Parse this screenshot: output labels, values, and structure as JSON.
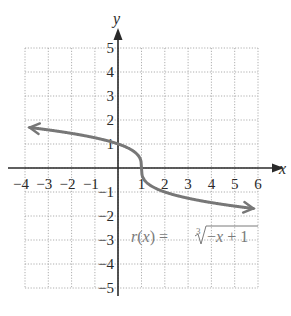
{
  "chart_data": {
    "type": "line",
    "title": "",
    "xlabel": "x",
    "ylabel": "y",
    "xlim": [
      -4,
      6
    ],
    "ylim": [
      -5,
      5
    ],
    "grid": true,
    "grid_style": "dotted",
    "x_ticks": [
      "-4",
      "-3",
      "-2",
      "-1",
      "1",
      "2",
      "3",
      "4",
      "5",
      "6"
    ],
    "y_ticks": [
      "5",
      "4",
      "3",
      "2",
      "1",
      "-1",
      "-2",
      "-3",
      "-4",
      "-5"
    ],
    "series": [
      {
        "name": "r(x) = cube root of (-x + 1)",
        "function": "cbrt(-x + 1)",
        "color": "#777777",
        "arrows": "both",
        "x": [
          -4,
          -3,
          -2,
          -1,
          0,
          0.5,
          1,
          1.5,
          2,
          3,
          4,
          5,
          6
        ],
        "y": [
          1.71,
          1.59,
          1.44,
          1.26,
          1.0,
          0.79,
          0,
          -0.79,
          -1.0,
          -1.26,
          -1.44,
          -1.59,
          -1.71
        ]
      }
    ],
    "annotations": [
      {
        "text": "r(x) = ∛(−x + 1)",
        "x": 0.6,
        "y": -3
      }
    ]
  },
  "labels": {
    "x_axis": "x",
    "y_axis": "y",
    "function_name": "r(x) = ",
    "radical_index": "3",
    "radicand": "−x + 1"
  },
  "colors": {
    "axis": "#2a2a2a",
    "grid": "#9a9a9a",
    "curve": "#777777",
    "label": "#7a7a7a"
  }
}
